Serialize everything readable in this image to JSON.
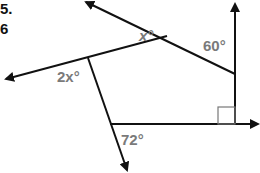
{
  "problem": {
    "number": "5.",
    "number_partial": "6"
  },
  "diagram": {
    "type": "polygon-exterior-angles",
    "angles": [
      {
        "id": "top-left",
        "label": "x°"
      },
      {
        "id": "top-right",
        "label": "60°"
      },
      {
        "id": "left",
        "label": "2x°"
      },
      {
        "id": "bottom-left",
        "label": "72°"
      },
      {
        "id": "bottom-right",
        "label": "right-angle",
        "marker": "square"
      }
    ],
    "label_color": "#7a7a7a",
    "line_color": "#111111"
  }
}
